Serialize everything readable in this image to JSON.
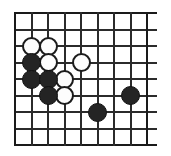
{
  "figure": {
    "kind": "go-board-diagram"
  },
  "board": {
    "name": "go-board",
    "columns": 9,
    "rows": 9,
    "origin_x": 14,
    "origin_y": 12,
    "spacing": 16.5,
    "line_color": "#2b2b2b",
    "edge_color": "#1a1a1a",
    "background_color": "#ffffff",
    "extend_right": 11,
    "extend_bottom": 0,
    "line_width": 2
  },
  "stones": {
    "black_color": "#242424",
    "white_color": "#fdfdfd",
    "radius": 9.5,
    "items": [
      {
        "id": "w1",
        "color": "white",
        "col": 1,
        "row": 2,
        "label": "white-stone-c3"
      },
      {
        "id": "w2",
        "color": "white",
        "col": 2,
        "row": 2,
        "label": "white-stone-d3"
      },
      {
        "id": "w3",
        "color": "white",
        "col": 2,
        "row": 3,
        "label": "white-stone-d4"
      },
      {
        "id": "w4",
        "color": "white",
        "col": 4,
        "row": 3,
        "label": "white-stone-f4"
      },
      {
        "id": "w5",
        "color": "white",
        "col": 3,
        "row": 4,
        "label": "white-stone-e5"
      },
      {
        "id": "w6",
        "color": "white",
        "col": 3,
        "row": 5,
        "label": "white-stone-e6"
      },
      {
        "id": "b1",
        "color": "black",
        "col": 1,
        "row": 3,
        "label": "black-stone-c4"
      },
      {
        "id": "b2",
        "color": "black",
        "col": 1,
        "row": 4,
        "label": "black-stone-c5"
      },
      {
        "id": "b3",
        "color": "black",
        "col": 2,
        "row": 4,
        "label": "black-stone-d5"
      },
      {
        "id": "b4",
        "color": "black",
        "col": 2,
        "row": 5,
        "label": "black-stone-d6"
      },
      {
        "id": "b5",
        "color": "black",
        "col": 5,
        "row": 6,
        "label": "black-stone-g7"
      },
      {
        "id": "b6",
        "color": "black",
        "col": 7,
        "row": 5,
        "label": "black-stone-j6"
      }
    ]
  }
}
